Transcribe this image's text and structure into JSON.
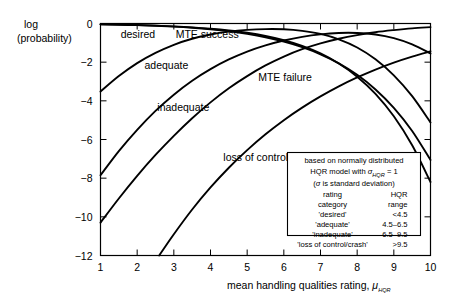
{
  "chart_data": {
    "type": "line",
    "title": "",
    "xlabel": "mean handling qualities rating, μHQR",
    "ylabel": "log (probability)",
    "xlim": [
      1,
      10
    ],
    "ylim": [
      -12,
      0
    ],
    "xticks": [
      "1",
      "2",
      "3",
      "4",
      "5",
      "6",
      "7",
      "8",
      "9",
      "10"
    ],
    "yticks": [
      "0",
      "−2",
      "−4",
      "−6",
      "−8",
      "−10",
      "−12"
    ],
    "grid": false,
    "legend_position": "inside-bottom-right",
    "series": [
      {
        "name": "desired",
        "label": "desired",
        "x": [
          1,
          1.5,
          2,
          2.5,
          3,
          3.5,
          4,
          4.5,
          5,
          5.5,
          6,
          6.5,
          7,
          7.5,
          8,
          8.5,
          9,
          9.5,
          10
        ],
        "y": [
          -0.046,
          -0.063,
          -0.086,
          -0.119,
          -0.163,
          -0.222,
          -0.301,
          -0.404,
          -0.539,
          -0.713,
          -0.937,
          -1.224,
          -1.592,
          -2.06,
          -2.656,
          -3.41,
          -4.362,
          -5.56,
          -7.06
        ]
      },
      {
        "name": "adequate",
        "label": "adequate",
        "x": [
          1,
          1.5,
          2,
          2.5,
          3,
          3.5,
          4,
          4.5,
          5,
          5.5,
          6,
          6.5,
          7,
          7.5,
          8,
          8.5,
          9,
          9.5,
          10
        ],
        "y": [
          -3.52,
          -2.72,
          -2.05,
          -1.52,
          -1.1,
          -0.79,
          -0.57,
          -0.42,
          -0.33,
          -0.29,
          -0.3,
          -0.38,
          -0.54,
          -0.82,
          -1.24,
          -1.85,
          -2.68,
          -3.76,
          -5.12
        ]
      },
      {
        "name": "inadequate",
        "label": "inadequate",
        "x": [
          1,
          1.5,
          2,
          2.5,
          3,
          3.5,
          4,
          4.5,
          5,
          5.5,
          6,
          6.5,
          7,
          7.5,
          8,
          8.5,
          9,
          9.5,
          10
        ],
        "y": [
          -7.85,
          -6.6,
          -5.5,
          -4.52,
          -3.68,
          -2.96,
          -2.36,
          -1.86,
          -1.45,
          -1.13,
          -0.88,
          -0.69,
          -0.56,
          -0.49,
          -0.49,
          -0.57,
          -0.76,
          -1.08,
          -1.55
        ]
      },
      {
        "name": "loss of control/crash",
        "label": "loss of control/crash",
        "x": [
          2.6,
          3,
          3.5,
          4,
          4.5,
          5,
          5.5,
          6,
          6.5,
          7,
          7.5,
          8,
          8.5,
          9,
          9.5,
          10
        ],
        "y": [
          -12,
          -10.9,
          -9.62,
          -8.48,
          -7.46,
          -6.55,
          -5.73,
          -5.0,
          -4.35,
          -3.77,
          -3.25,
          -2.79,
          -2.38,
          -2.02,
          -1.71,
          -1.44
        ]
      },
      {
        "name": "MTE success",
        "label": "MTE success",
        "x": [
          1,
          1.5,
          2,
          2.5,
          3,
          3.5,
          4,
          4.5,
          5,
          5.5,
          6,
          6.5,
          7,
          7.5,
          8,
          8.5,
          9,
          9.5,
          10
        ],
        "y": [
          -0.044,
          -0.06,
          -0.081,
          -0.11,
          -0.149,
          -0.2,
          -0.268,
          -0.36,
          -0.48,
          -0.645,
          -0.865,
          -1.16,
          -1.55,
          -2.07,
          -2.75,
          -3.64,
          -4.8,
          -6.3,
          -8.2
        ]
      },
      {
        "name": "MTE failure",
        "label": "MTE failure",
        "x": [
          1,
          1.5,
          2,
          2.5,
          3,
          3.5,
          4,
          4.5,
          5,
          5.5,
          6,
          6.5,
          7,
          7.5,
          8,
          8.5,
          9,
          9.5,
          10
        ],
        "y": [
          -10.3,
          -9.05,
          -7.88,
          -6.8,
          -5.81,
          -4.9,
          -4.08,
          -3.35,
          -2.72,
          -2.17,
          -1.71,
          -1.33,
          -1.03,
          -0.79,
          -0.6,
          -0.45,
          -0.34,
          -0.25,
          -0.19
        ]
      }
    ],
    "annotations": [
      {
        "text": "desired",
        "x": 1.55,
        "y": -0.75
      },
      {
        "text": "MTE success",
        "x": 3.05,
        "y": -0.75
      },
      {
        "text": "adequate",
        "x": 2.2,
        "y": -2.35
      },
      {
        "text": "inadequate",
        "x": 2.55,
        "y": -4.55
      },
      {
        "text": "loss of control/crash",
        "x": 4.35,
        "y": -7.1
      },
      {
        "text": "MTE failure",
        "x": 5.3,
        "y": -2.95
      }
    ]
  },
  "axes": {
    "y_label_line1": "log",
    "y_label_line2": "(probability)",
    "x_label_main": "mean handling qualities rating,",
    "x_label_symbol": "μ",
    "x_label_symbol_sub": "HQR"
  },
  "legend": {
    "line1": "based on normally distributed",
    "line2_pre": "HQR model with ",
    "line2_symbol": "σ",
    "line2_symbol_sub": "HQR",
    "line2_post": " = 1",
    "line3_pre": "(",
    "line3_symbol": "σ",
    "line3_post": " is standard deviation)",
    "header_left_line1": "rating",
    "header_left_line2": "category",
    "header_right_line1": "HQR",
    "header_right_line2": "range",
    "rows": [
      {
        "category": "'desired'",
        "range": "<4.5"
      },
      {
        "category": "'adequate'",
        "range": "4.5–6.5"
      },
      {
        "category": "'inadequate'",
        "range": "6.5–9.5"
      },
      {
        "category": "'loss of control/crash'",
        "range": ">9.5"
      }
    ]
  },
  "colors": {
    "ink": "#000000",
    "paper": "#ffffff"
  }
}
